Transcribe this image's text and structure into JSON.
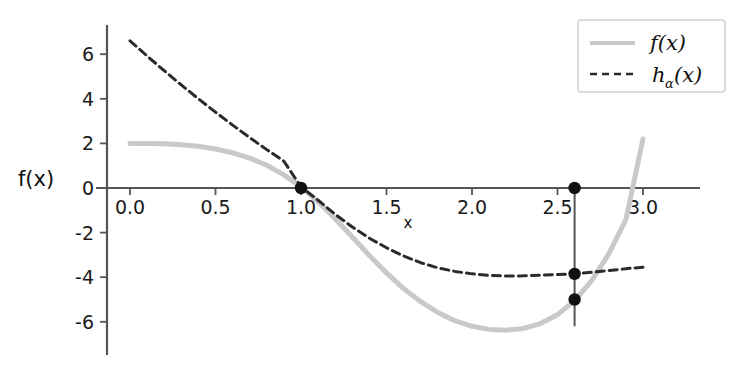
{
  "chart_data": {
    "type": "line",
    "title": "",
    "xlabel": "x",
    "ylabel": "f(x)",
    "xlim": [
      -0.13,
      3.2
    ],
    "ylim": [
      -7.3,
      7.3
    ],
    "grid": false,
    "xticks": [
      "0.0",
      "0.5",
      "1.0",
      "1.5",
      "2.0",
      "2.5",
      "3.0"
    ],
    "xtick_values": [
      0.0,
      0.5,
      1.0,
      1.5,
      2.0,
      2.5,
      3.0
    ],
    "yticks": [
      "6",
      "4",
      "2",
      "0",
      "-2",
      "-4",
      "-6"
    ],
    "ytick_values": [
      6,
      4,
      2,
      0,
      -2,
      -4,
      -6
    ],
    "legend": {
      "position": "top-right",
      "entries": [
        {
          "label": "f(x)",
          "sub": "",
          "style": "solid",
          "color": "#c9c9c9"
        },
        {
          "label": "h",
          "sub": "α",
          "suffix": "(x)",
          "style": "dashed",
          "color": "#2b2b2b"
        }
      ]
    },
    "series": [
      {
        "name": "f(x)",
        "style": "solid",
        "color": "#c9c9c9",
        "width": 5,
        "x": [
          0.0,
          0.1,
          0.2,
          0.3,
          0.4,
          0.5,
          0.6,
          0.7,
          0.8,
          0.9,
          1.0,
          1.1,
          1.2,
          1.3,
          1.4,
          1.5,
          1.6,
          1.7,
          1.8,
          1.9,
          2.0,
          2.1,
          2.2,
          2.3,
          2.4,
          2.5,
          2.6,
          2.7,
          2.8,
          2.9,
          3.0
        ],
        "y": [
          2.0,
          2.0,
          1.98,
          1.94,
          1.87,
          1.75,
          1.58,
          1.34,
          1.02,
          0.59,
          0.05,
          -0.62,
          -1.38,
          -2.2,
          -3.03,
          -3.81,
          -4.51,
          -5.1,
          -5.58,
          -5.95,
          -6.2,
          -6.34,
          -6.38,
          -6.3,
          -6.08,
          -5.68,
          -5.05,
          -4.15,
          -2.95,
          -1.42,
          2.2
        ]
      },
      {
        "name": "h_alpha(x)",
        "style": "dashed",
        "color": "#2b2b2b",
        "width": 3,
        "x": [
          0.0,
          0.1,
          0.2,
          0.3,
          0.4,
          0.5,
          0.6,
          0.7,
          0.8,
          0.9,
          1.0,
          1.1,
          1.2,
          1.3,
          1.4,
          1.5,
          1.6,
          1.7,
          1.8,
          1.9,
          2.0,
          2.1,
          2.2,
          2.3,
          2.4,
          2.5,
          2.6,
          2.7,
          2.8,
          2.9,
          3.0
        ],
        "y": [
          6.6,
          5.92,
          5.26,
          4.62,
          4.0,
          3.4,
          2.82,
          2.26,
          1.72,
          1.2,
          0.05,
          -0.55,
          -1.18,
          -1.75,
          -2.25,
          -2.68,
          -3.05,
          -3.35,
          -3.58,
          -3.74,
          -3.85,
          -3.92,
          -3.95,
          -3.94,
          -3.91,
          -3.88,
          -3.85,
          -3.78,
          -3.7,
          -3.62,
          -3.55
        ]
      }
    ],
    "vertical_line": {
      "x": 2.6,
      "y_top": 0.0,
      "y_bottom": -6.2,
      "color": "#555555"
    },
    "markers": [
      {
        "x": 1.0,
        "y": 0.0,
        "label": ""
      },
      {
        "x": 2.6,
        "y": 0.0,
        "label": ""
      },
      {
        "x": 2.6,
        "y": -3.85,
        "label": ""
      },
      {
        "x": 2.6,
        "y": -5.0,
        "label": ""
      }
    ],
    "axes_color": "#555555"
  }
}
